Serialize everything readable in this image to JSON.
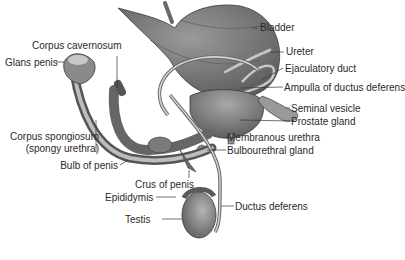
{
  "figure": {
    "type": "anatomical illustration",
    "colors": {
      "background": "#ffffff",
      "tissue": "#8a8a8a",
      "tissue_dark": "#5a5a5a",
      "tissue_light": "#c4c4c4",
      "leader_line": "#333333",
      "text": "#2a2a2a"
    }
  },
  "labels": {
    "bladder": "Bladder",
    "ureter": "Ureter",
    "ejaculatory_duct": "Ejaculatory duct",
    "ampulla": "Ampulla of ductus deferens",
    "seminal_vesicle": "Seminal vesicle",
    "prostate_gland": "Prostate gland",
    "membranous_urethra": "Membranous urethra",
    "bulbourethral_gland": "Bulbourethral gland",
    "ductus_deferens": "Ductus deferens",
    "corpus_cavernosum": "Corpus cavernosum",
    "glans_penis": "Glans penis",
    "corpus_spongiosum": "Corpus spongiosum",
    "spongy_urethra": "(spongy urethra)",
    "bulb_of_penis": "Bulb of penis",
    "crus_of_penis": "Crus of penis",
    "epididymis": "Epididymis",
    "testis": "Testis"
  }
}
